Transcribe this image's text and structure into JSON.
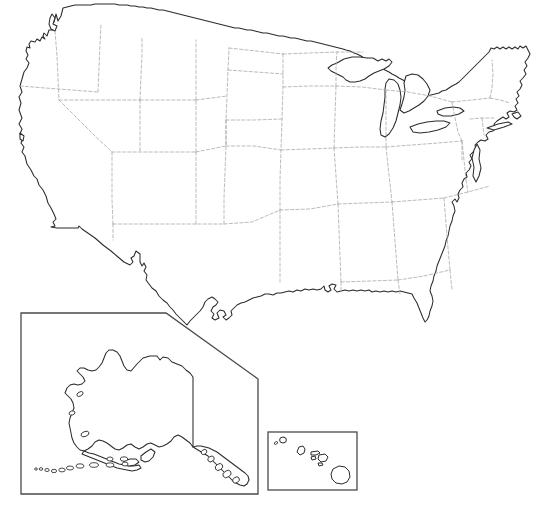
{
  "document": {
    "kind": "blank-outline-map",
    "title": "United States Outline Map",
    "background_color": "#ffffff",
    "width": 544,
    "height": 532,
    "labels_present": false,
    "legend_present": false
  },
  "style": {
    "coastline_color": "#2b2b2b",
    "state_border_color": "#a9a9ae",
    "state_border_style": "dashed",
    "inset_frame_color": "#4a4a4a",
    "land_fill": "#ffffff"
  },
  "map": {
    "main_region_name": "contiguous-united-states",
    "features": [
      {
        "name": "lower-48-landmass",
        "type": "outline"
      },
      {
        "name": "great-lakes",
        "type": "water-body"
      },
      {
        "name": "state-boundaries",
        "type": "internal-borders"
      }
    ]
  },
  "insets": [
    {
      "name": "alaska-inset",
      "region": "Alaska",
      "frame": {
        "x": 21,
        "y": 313,
        "width": 237,
        "height": 181
      },
      "frame_shape": "rectangle-with-diagonal-top-right-corner"
    },
    {
      "name": "hawaii-inset",
      "region": "Hawaii",
      "frame": {
        "x": 268,
        "y": 432,
        "width": 89,
        "height": 58
      },
      "frame_shape": "rectangle"
    }
  ]
}
